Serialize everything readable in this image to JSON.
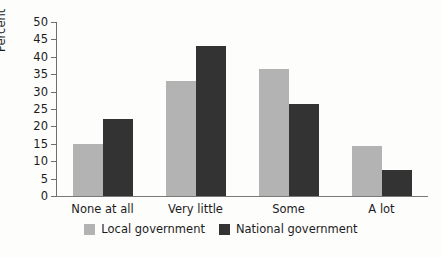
{
  "chart_data": {
    "type": "bar",
    "title": "",
    "xlabel": "",
    "ylabel": "Percent",
    "ylim": [
      0,
      50
    ],
    "yticks": [
      0,
      5,
      10,
      15,
      20,
      25,
      30,
      35,
      40,
      45,
      50
    ],
    "grid": false,
    "legend_position": "bottom",
    "categories": [
      "None at all",
      "Very little",
      "Some",
      "A lot"
    ],
    "series": [
      {
        "name": "Local government",
        "color": "#b3b3b3",
        "values": [
          15,
          33,
          36.5,
          14.5
        ]
      },
      {
        "name": "National government",
        "color": "#333333",
        "values": [
          22,
          43,
          26.5,
          7.5
        ]
      }
    ]
  }
}
